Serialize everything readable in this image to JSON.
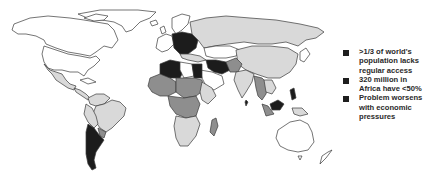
{
  "map": {
    "title": "World water access map",
    "legend_shades": {
      "white": "#ffffff",
      "light": "#d9d9d9",
      "mid": "#8e8e8e",
      "dark": "#1c1c1c"
    }
  },
  "legend": {
    "bullets": [
      {
        "text": ">1/3 of world's\npopulation lacks\nregular access"
      },
      {
        "text": "320 million in\nAfrica have <50%"
      },
      {
        "text": "Problem worsens\nwith economic\npressures"
      }
    ]
  }
}
